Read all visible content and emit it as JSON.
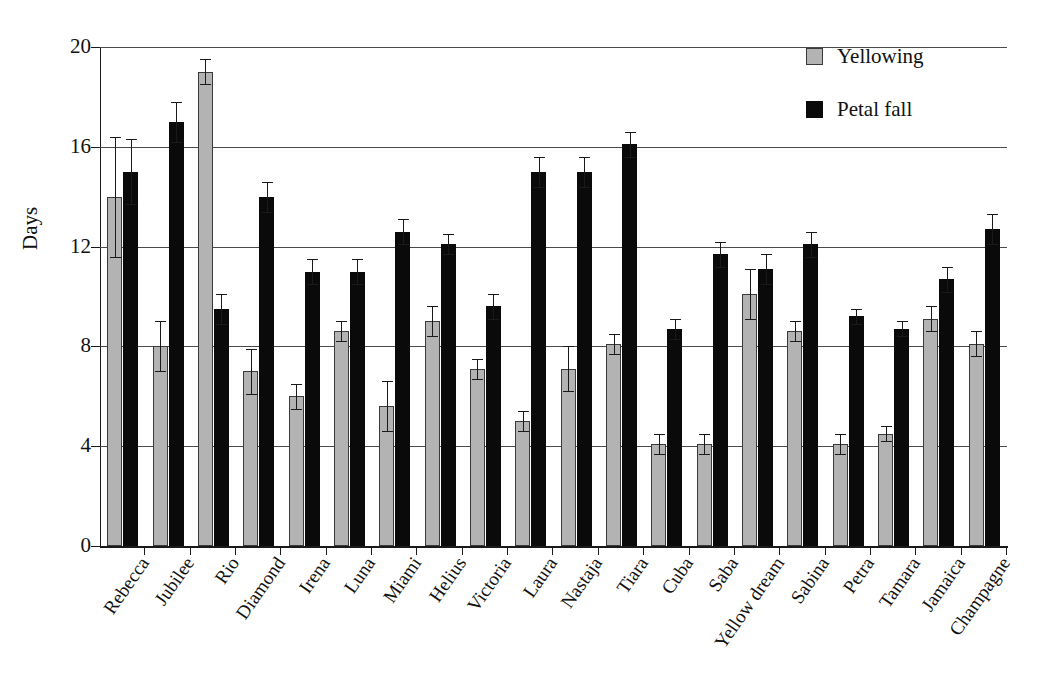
{
  "chart_data": {
    "type": "bar",
    "title": "",
    "xlabel": "",
    "ylabel": "Days",
    "ylim": [
      0,
      20
    ],
    "yticks": [
      0,
      4,
      8,
      12,
      16,
      20
    ],
    "grid": true,
    "legend_position": "top-right",
    "categories": [
      "Rebecca",
      "Jubilee",
      "Rio",
      "Diamond",
      "Irena",
      "Luna",
      "Miami",
      "Helius",
      "Victoria",
      "Laura",
      "Nastaja",
      "Tiara",
      "Cuba",
      "Saba",
      "Yellow dream",
      "Sabina",
      "Petra",
      "Tamara",
      "Jamaica",
      "Champagne"
    ],
    "series": [
      {
        "name": "Yellowing",
        "color": "#b3b3b3",
        "values": [
          14.0,
          8.0,
          19.0,
          7.0,
          6.0,
          8.6,
          5.6,
          9.0,
          7.1,
          5.0,
          7.1,
          8.1,
          4.1,
          4.1,
          10.1,
          8.6,
          4.1,
          4.5,
          9.1,
          8.1
        ],
        "errors": [
          2.4,
          1.0,
          0.5,
          0.9,
          0.5,
          0.4,
          1.0,
          0.6,
          0.4,
          0.4,
          0.9,
          0.4,
          0.4,
          0.4,
          1.0,
          0.4,
          0.4,
          0.3,
          0.5,
          0.5
        ]
      },
      {
        "name": "Petal fall",
        "color": "#0a0a0a",
        "values": [
          15.0,
          17.0,
          9.5,
          14.0,
          11.0,
          11.0,
          12.6,
          12.1,
          9.6,
          15.0,
          15.0,
          16.1,
          8.7,
          11.7,
          11.1,
          12.1,
          9.2,
          8.7,
          10.7,
          12.7
        ],
        "errors": [
          1.3,
          0.8,
          0.6,
          0.6,
          0.5,
          0.5,
          0.5,
          0.4,
          0.5,
          0.6,
          0.6,
          0.5,
          0.4,
          0.5,
          0.6,
          0.5,
          0.3,
          0.3,
          0.5,
          0.6
        ]
      }
    ]
  },
  "legend": {
    "items": [
      {
        "label": "Yellowing",
        "swatch": "yellowing"
      },
      {
        "label": "Petal fall",
        "swatch": "petal"
      }
    ]
  },
  "axis": {
    "y_title": "Days"
  }
}
